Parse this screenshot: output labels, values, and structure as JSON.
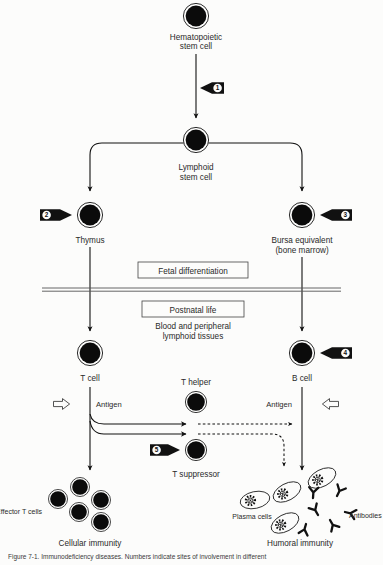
{
  "figure": {
    "title_label": "Figure 7-1.",
    "caption": "Figure 7-1.  Immunodeficiency diseases. Numbers indicate sites of involvement in different",
    "background_color": "#fcfcfb",
    "ink_color": "#111111",
    "cell_fill": "#0b0b0b"
  },
  "nodes": {
    "hematopoietic_stem_cell": "Hematopoietic\nstem cell",
    "hematopoietic_stem_cell_line1": "Hematopoietic",
    "hematopoietic_stem_cell_line2": "stem cell",
    "lymphoid_stem_cell_line1": "Lymphoid",
    "lymphoid_stem_cell_line2": "stem cell",
    "thymus": "Thymus",
    "bursa_line1": "Bursa equivalent",
    "bursa_line2": "(bone marrow)",
    "t_cell": "T cell",
    "b_cell": "B cell",
    "t_helper": "T helper",
    "t_suppressor": "T suppressor",
    "effector_t_cells": "Effector T cells",
    "plasma_cells": "Plasma cells",
    "antibodies": "Antibodies",
    "cellular_immunity": "Cellular immunity",
    "humoral_immunity": "Humoral immunity"
  },
  "stage_boxes": {
    "fetal": "Fetal differentiation",
    "postnatal": "Postnatal life"
  },
  "tissue_note": {
    "line1": "Blood and peripheral",
    "line2": "lymphoid tissues"
  },
  "antigen_labels": {
    "left": "Antigen",
    "right": "Antigen"
  },
  "markers": [
    {
      "id": "1",
      "label": "1",
      "points": "left",
      "target": "hematopoietic to lymphoid stem cell arrow"
    },
    {
      "id": "2",
      "label": "2",
      "points": "right",
      "target": "thymus"
    },
    {
      "id": "3",
      "label": "3",
      "points": "left",
      "target": "bursa equivalent"
    },
    {
      "id": "4",
      "label": "4",
      "points": "left",
      "target": "b cell"
    },
    {
      "id": "5",
      "label": "5",
      "points": "right",
      "target": "t suppressor"
    }
  ],
  "icons": {
    "cell": "filled-cell-icon",
    "marker": "numbered-pointer-icon",
    "antigen_arrow": "hollow-arrow-icon",
    "plasma_cell": "plasma-cell-icon",
    "antibody": "antibody-y-icon",
    "arrow": "arrowhead-icon"
  }
}
